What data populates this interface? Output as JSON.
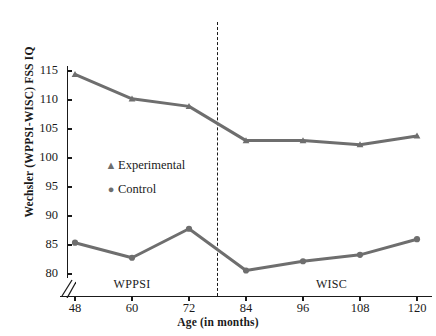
{
  "chart_data": {
    "type": "line",
    "title": "",
    "xlabel": "Age (in months)",
    "ylabel": "Wechsler (WPPSI-WISC) FSS IQ",
    "x": [
      48,
      60,
      72,
      84,
      96,
      108,
      120
    ],
    "xticklabels": [
      "48",
      "60",
      "72",
      "84",
      "96",
      "108",
      "120"
    ],
    "yticklabels": [
      "80",
      "85",
      "90",
      "95",
      "100",
      "105",
      "110",
      "115"
    ],
    "yticks": [
      80,
      85,
      90,
      95,
      100,
      105,
      110,
      115
    ],
    "ylim": [
      78.5,
      116.5
    ],
    "xlim": [
      42,
      126
    ],
    "grid": false,
    "legend_position": "inside-left",
    "y_axis_break": true,
    "series": [
      {
        "name": "Experimental",
        "marker": "triangle",
        "color": "#6e6e6e",
        "values": [
          114.4,
          110.2,
          108.9,
          103.0,
          103.0,
          102.3,
          103.8
        ]
      },
      {
        "name": "Control",
        "marker": "circle",
        "color": "#6e6e6e",
        "values": [
          85.4,
          82.8,
          87.8,
          80.6,
          82.2,
          83.3,
          86.0
        ]
      }
    ],
    "annotations": [
      {
        "text": "WPPSI",
        "x": 60,
        "region": "left"
      },
      {
        "text": "WISC",
        "x": 102,
        "region": "right"
      }
    ],
    "divider": {
      "x": 78,
      "style": "dashed"
    }
  },
  "legend": {
    "items": [
      {
        "label": "Experimental",
        "glyph": "▲"
      },
      {
        "label": "Control",
        "glyph": "●"
      }
    ]
  }
}
